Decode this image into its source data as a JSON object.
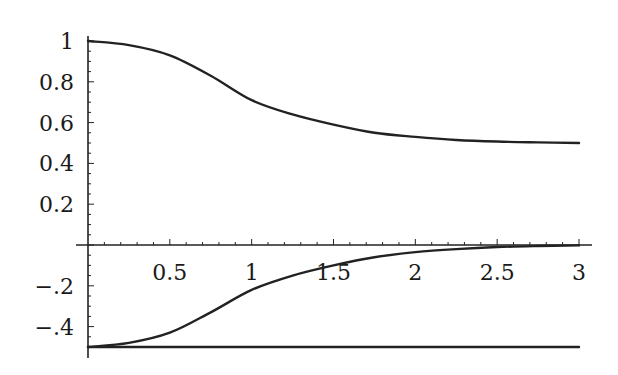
{
  "chart_data": {
    "type": "line",
    "title": "",
    "xlabel": "",
    "ylabel": "",
    "xlim": [
      0,
      3
    ],
    "ylim": [
      -0.5,
      1
    ],
    "grid": false,
    "legend": null,
    "x_ticks": [
      "0.5",
      "1",
      "1.5",
      "2",
      "2.5",
      "3"
    ],
    "y_ticks": [
      "1",
      "0.8",
      "0.6",
      "0.4",
      "0.2",
      "−.2",
      "−.4"
    ],
    "x": [
      0,
      0.25,
      0.5,
      0.75,
      1,
      1.25,
      1.5,
      1.75,
      2,
      2.25,
      2.5,
      2.75,
      3
    ],
    "series": [
      {
        "name": "upper",
        "values": [
          1.0,
          0.98,
          0.93,
          0.83,
          0.71,
          0.64,
          0.59,
          0.55,
          0.53,
          0.515,
          0.507,
          0.503,
          0.5
        ]
      },
      {
        "name": "lower",
        "values": [
          -0.5,
          -0.48,
          -0.43,
          -0.33,
          -0.22,
          -0.15,
          -0.1,
          -0.06,
          -0.035,
          -0.02,
          -0.01,
          -0.005,
          -0.002
        ]
      },
      {
        "name": "baseline",
        "values": [
          -0.5,
          -0.5,
          -0.5,
          -0.5,
          -0.5,
          -0.5,
          -0.5,
          -0.5,
          -0.5,
          -0.5,
          -0.5,
          -0.5,
          -0.5
        ]
      }
    ]
  }
}
